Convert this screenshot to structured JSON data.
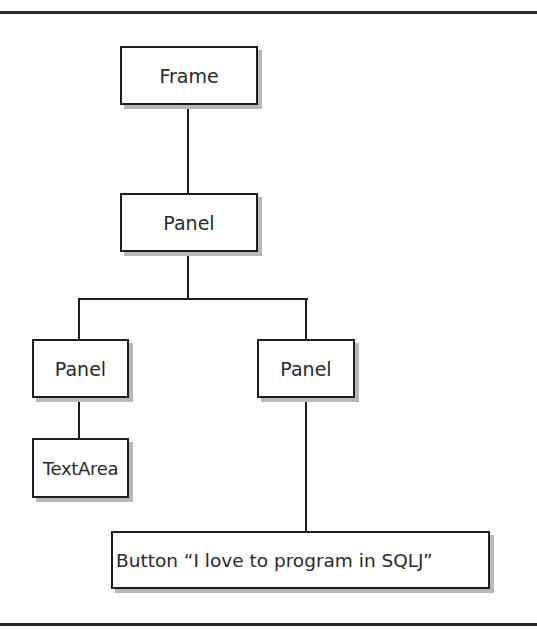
{
  "diagram": {
    "nodes": {
      "frame": {
        "label": "Frame"
      },
      "panel_root": {
        "label": "Panel"
      },
      "panel_left": {
        "label": "Panel"
      },
      "panel_right": {
        "label": "Panel"
      },
      "textarea": {
        "label": "TextArea"
      },
      "button": {
        "label": "Button “I love to program in SQLJ”"
      }
    },
    "edges": [
      [
        "Frame",
        "Panel"
      ],
      [
        "Panel",
        "Panel (left)"
      ],
      [
        "Panel",
        "Panel (right)"
      ],
      [
        "Panel (left)",
        "TextArea"
      ],
      [
        "Panel (right)",
        "Button “I love to program in SQLJ”"
      ]
    ]
  }
}
